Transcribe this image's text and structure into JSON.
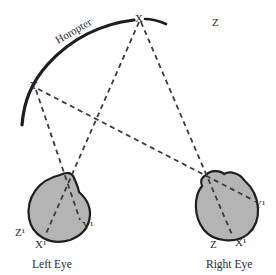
{
  "diagram": {
    "curve_label": "Horopter",
    "points": {
      "x": "X",
      "y": "Y",
      "z": "Z"
    },
    "left_eye": {
      "caption": "Left Eye",
      "retina_labels": {
        "z": "Z¹",
        "x": "X¹",
        "y": "Y¹"
      }
    },
    "right_eye": {
      "caption": "Right Eye",
      "retina_labels": {
        "z": "Z",
        "x": "X¹",
        "y": "Y¹"
      }
    },
    "colors": {
      "eye_fill": "#b4b4b4",
      "stroke": "#1e1e1e",
      "dash": "#3a3a3a"
    }
  }
}
